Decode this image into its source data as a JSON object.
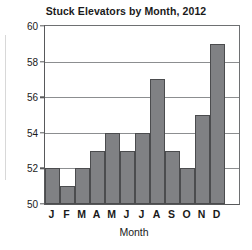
{
  "chart_data": {
    "type": "bar",
    "title": "Stuck Elevators by Month, 2012",
    "xlabel": "Month",
    "ylabel": "",
    "categories": [
      "J",
      "F",
      "M",
      "A",
      "M",
      "J",
      "J",
      "A",
      "S",
      "O",
      "N",
      "D"
    ],
    "category_full_names": [
      "January",
      "February",
      "March",
      "April",
      "May",
      "June",
      "July",
      "August",
      "September",
      "October",
      "November",
      "December"
    ],
    "values": [
      52,
      51,
      52,
      53,
      54,
      53,
      54,
      57,
      53,
      52,
      55,
      59
    ],
    "ylim": [
      50,
      60
    ],
    "yticks": [
      50,
      52,
      54,
      56,
      58,
      60
    ],
    "ytick_labels": [
      "50",
      "52",
      "54",
      "56",
      "58",
      "60"
    ],
    "grid": true,
    "grid_axis": "y",
    "legend": false,
    "bar_fill_color": "#808184",
    "bar_edge_color": "#4b4c4e",
    "gridline_color": "#8c8e90",
    "axis_color": "#58595b",
    "text_color": "#1a1a1a",
    "background_color": "#ffffff",
    "bar_gap": 0,
    "plot_right_margin_note": "bars occupy left ~92% of plot area; blank space to the right of December"
  }
}
